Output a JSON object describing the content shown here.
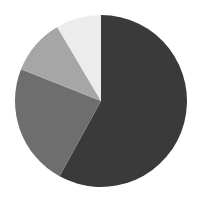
{
  "chart_data": {
    "type": "pie",
    "title": "",
    "categories": [
      "Slice A",
      "Slice B",
      "Slice C",
      "Slice D"
    ],
    "values": [
      58,
      23,
      10.5,
      8.5
    ],
    "colors": [
      "#3a3a3a",
      "#6e6e6e",
      "#a6a6a6",
      "#ececec"
    ],
    "start_angle_deg": 0,
    "direction": "clockwise",
    "legend": false,
    "labels_shown": false
  }
}
